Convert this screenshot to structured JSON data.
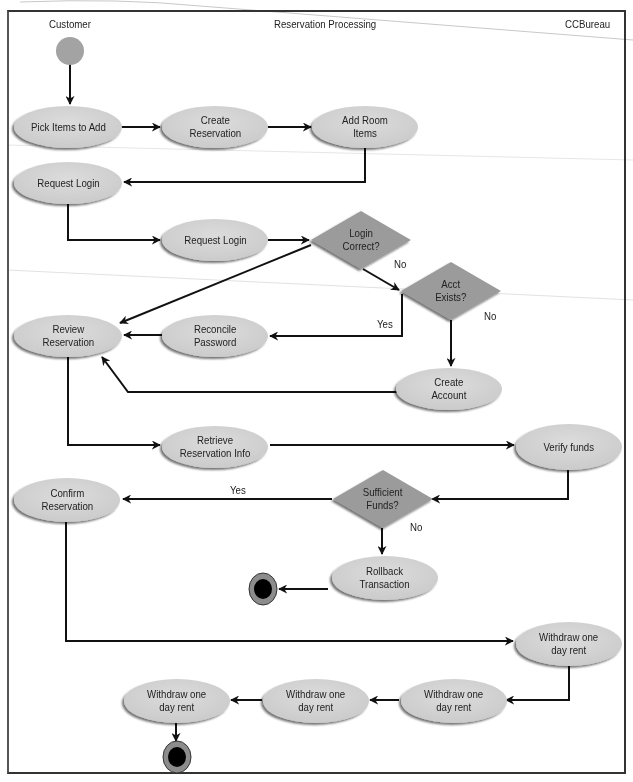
{
  "diagram": {
    "type": "uml-activity-diagram",
    "swimlanes": [
      {
        "id": "customer",
        "label": "Customer"
      },
      {
        "id": "reservation_processing",
        "label": "Reservation Processing"
      },
      {
        "id": "ccbureau",
        "label": "CCBureau"
      }
    ],
    "colors": {
      "activity_fill": "#d4d4d4",
      "activity_shadow": "#8a8a8a",
      "decision_fill": "#9a9a9a",
      "start_fill": "#a0a0a0",
      "end_outer": "#8c8c8c",
      "end_inner": "#000000",
      "line": "#111111",
      "frame": "#333333"
    },
    "nodes": {
      "start": {
        "kind": "initial",
        "lane": "customer"
      },
      "pick_items": {
        "kind": "activity",
        "label": "Pick Items to Add",
        "lane": "customer"
      },
      "create_reservation": {
        "kind": "activity",
        "label": "Create\nReservation",
        "lane": "reservation_processing"
      },
      "add_room_items": {
        "kind": "activity",
        "label": "Add Room\nItems",
        "lane": "reservation_processing"
      },
      "request_login_customer": {
        "kind": "activity",
        "label": "Request Login",
        "lane": "customer"
      },
      "request_login_processing": {
        "kind": "activity",
        "label": "Request Login",
        "lane": "reservation_processing"
      },
      "login_correct": {
        "kind": "decision",
        "label": "Login\nCorrect?",
        "lane": "reservation_processing"
      },
      "acct_exists": {
        "kind": "decision",
        "label": "Acct\nExists?",
        "lane": "reservation_processing"
      },
      "review_reservation": {
        "kind": "activity",
        "label": "Review\nReservation",
        "lane": "customer"
      },
      "reconcile_password": {
        "kind": "activity",
        "label": "Reconcile\nPassword",
        "lane": "reservation_processing"
      },
      "create_account": {
        "kind": "activity",
        "label": "Create\nAccount",
        "lane": "reservation_processing"
      },
      "retrieve_reservation_info": {
        "kind": "activity",
        "label": "Retrieve\nReservation Info",
        "lane": "reservation_processing"
      },
      "verify_funds": {
        "kind": "activity",
        "label": "Verify funds",
        "lane": "ccbureau"
      },
      "sufficient_funds": {
        "kind": "decision",
        "label": "Sufficient\nFunds?",
        "lane": "reservation_processing"
      },
      "confirm_reservation": {
        "kind": "activity",
        "label": "Confirm\nReservation",
        "lane": "customer"
      },
      "rollback_transaction": {
        "kind": "activity",
        "label": "Rollback\nTransaction",
        "lane": "reservation_processing"
      },
      "end_rollback": {
        "kind": "final",
        "lane": "reservation_processing"
      },
      "withdraw_1": {
        "kind": "activity",
        "label": "Withdraw one\nday rent",
        "lane": "ccbureau"
      },
      "withdraw_2": {
        "kind": "activity",
        "label": "Withdraw one\nday rent",
        "lane": "ccbureau"
      },
      "withdraw_3": {
        "kind": "activity",
        "label": "Withdraw one\nday rent",
        "lane": "reservation_processing"
      },
      "withdraw_4": {
        "kind": "activity",
        "label": "Withdraw one\nday rent",
        "lane": "customer"
      },
      "end_main": {
        "kind": "final",
        "lane": "customer"
      }
    },
    "guards": {
      "login_no": "No",
      "acct_yes": "Yes",
      "acct_no": "No",
      "funds_yes": "Yes",
      "funds_no": "No"
    },
    "edges": [
      {
        "from": "start",
        "to": "pick_items"
      },
      {
        "from": "pick_items",
        "to": "create_reservation"
      },
      {
        "from": "create_reservation",
        "to": "add_room_items"
      },
      {
        "from": "add_room_items",
        "to": "request_login_customer"
      },
      {
        "from": "request_login_customer",
        "to": "request_login_processing"
      },
      {
        "from": "request_login_processing",
        "to": "login_correct"
      },
      {
        "from": "login_correct",
        "to": "review_reservation",
        "guard": "Yes (implied)"
      },
      {
        "from": "login_correct",
        "to": "acct_exists",
        "guard": "No"
      },
      {
        "from": "acct_exists",
        "to": "reconcile_password",
        "guard": "Yes"
      },
      {
        "from": "acct_exists",
        "to": "create_account",
        "guard": "No"
      },
      {
        "from": "reconcile_password",
        "to": "review_reservation"
      },
      {
        "from": "create_account",
        "to": "review_reservation"
      },
      {
        "from": "review_reservation",
        "to": "retrieve_reservation_info"
      },
      {
        "from": "retrieve_reservation_info",
        "to": "verify_funds"
      },
      {
        "from": "verify_funds",
        "to": "sufficient_funds"
      },
      {
        "from": "sufficient_funds",
        "to": "confirm_reservation",
        "guard": "Yes"
      },
      {
        "from": "sufficient_funds",
        "to": "rollback_transaction",
        "guard": "No"
      },
      {
        "from": "rollback_transaction",
        "to": "end_rollback"
      },
      {
        "from": "confirm_reservation",
        "to": "withdraw_1"
      },
      {
        "from": "withdraw_1",
        "to": "withdraw_2"
      },
      {
        "from": "withdraw_2",
        "to": "withdraw_3"
      },
      {
        "from": "withdraw_3",
        "to": "withdraw_4"
      },
      {
        "from": "withdraw_4",
        "to": "end_main"
      }
    ]
  }
}
